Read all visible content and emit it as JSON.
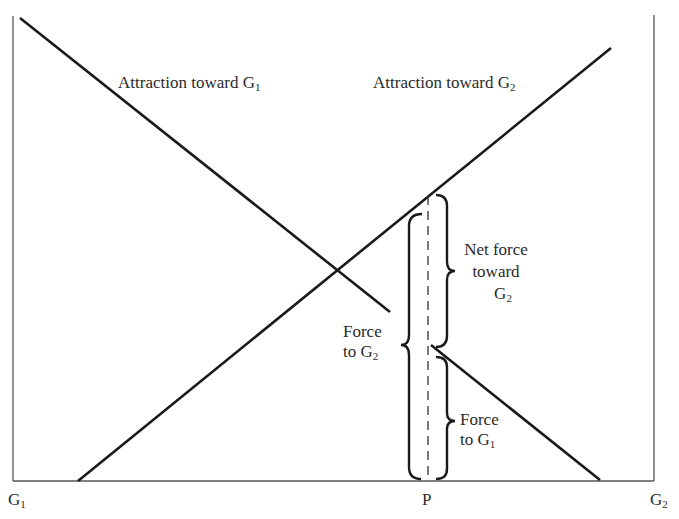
{
  "diagram": {
    "type": "force-diagram",
    "colors": {
      "background": "#ffffff",
      "line": "#1a1a1a",
      "axis": "#555555",
      "text": "#2a2a2a"
    },
    "axis": {
      "left_end_label": {
        "base": "G",
        "sub": "1"
      },
      "right_end_label": {
        "base": "G",
        "sub": "2"
      },
      "point_label": "P"
    },
    "lines": [
      {
        "name": "Attraction toward G1",
        "label": {
          "base": "Attraction toward G",
          "sub": "1"
        },
        "direction": "decreasing"
      },
      {
        "name": "Attraction toward G2",
        "label": {
          "base": "Attraction toward G",
          "sub": "2"
        },
        "direction": "increasing"
      }
    ],
    "brackets": {
      "force_to_g2": {
        "line1": "Force",
        "line2_base": "to G",
        "line2_sub": "2"
      },
      "net_force": {
        "line1": "Net force",
        "line2": "toward",
        "line3_base": "G",
        "line3_sub": "2"
      },
      "force_to_g1": {
        "line1": "Force",
        "line2_base": "to G",
        "line2_sub": "1"
      }
    }
  }
}
